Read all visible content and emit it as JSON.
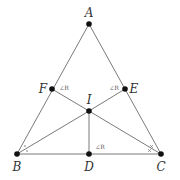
{
  "diagram": {
    "colors": {
      "line": "#6b6b6b",
      "point": "#111111",
      "label": "#333333",
      "annotation": "#555555"
    },
    "points": {
      "A": {
        "x": 89,
        "y": 24,
        "label": "A",
        "lx": 89,
        "ly": 13
      },
      "B": {
        "x": 17,
        "y": 154,
        "label": "B",
        "lx": 17,
        "ly": 167
      },
      "C": {
        "x": 161,
        "y": 154,
        "label": "C",
        "lx": 161,
        "ly": 167
      },
      "D": {
        "x": 89,
        "y": 154,
        "label": "D",
        "lx": 89,
        "ly": 167
      },
      "E": {
        "x": 125,
        "y": 89,
        "label": "E",
        "lx": 134,
        "ly": 89
      },
      "F": {
        "x": 52,
        "y": 89,
        "label": "F",
        "lx": 43,
        "ly": 89
      },
      "I": {
        "x": 89,
        "y": 111,
        "label": "I",
        "lx": 89,
        "ly": 100
      }
    },
    "segments": [
      [
        "A",
        "B"
      ],
      [
        "A",
        "C"
      ],
      [
        "B",
        "C"
      ],
      [
        "I",
        "B"
      ],
      [
        "I",
        "C"
      ],
      [
        "I",
        "D"
      ],
      [
        "I",
        "E"
      ],
      [
        "I",
        "F"
      ]
    ],
    "right_angle_labels": [
      {
        "text": "∠R",
        "x": 64,
        "y": 88,
        "at": "F"
      },
      {
        "text": "∠R",
        "x": 114,
        "y": 88,
        "at": "E"
      },
      {
        "text": "∠R",
        "x": 100,
        "y": 147,
        "at": "D"
      }
    ],
    "angle_marks": {
      "B": {
        "type": "single-dot",
        "count": 2
      },
      "C": {
        "type": "cross",
        "count": 2
      }
    }
  }
}
